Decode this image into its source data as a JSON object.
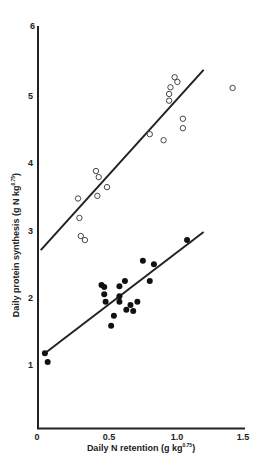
{
  "chart_data": {
    "type": "scatter",
    "title": "",
    "xlabel": "Daily N retention (g kg0.75)",
    "xlabel_main": "Daily N retention (g kg",
    "xlabel_sup": "0.75",
    "xlabel_close": ")",
    "ylabel": "Daily protein synthesis (g N kg0.75)",
    "ylabel_main": "Daily protein synthesis (g N kg",
    "ylabel_sup": "0.75",
    "ylabel_close": ")",
    "xlim": [
      0,
      1.5
    ],
    "ylim": [
      0,
      6
    ],
    "xticks": [
      "0",
      "0.5",
      "1.0",
      "1.5"
    ],
    "yticks": [
      "1",
      "2",
      "3",
      "4",
      "5",
      "6"
    ],
    "grid": false,
    "legend": null,
    "series": [
      {
        "name": "open circles",
        "marker": "open-circle",
        "points": [
          [
            0.29,
            3.47
          ],
          [
            0.3,
            3.18
          ],
          [
            0.31,
            2.91
          ],
          [
            0.34,
            2.85
          ],
          [
            0.42,
            3.88
          ],
          [
            0.44,
            3.79
          ],
          [
            0.43,
            3.51
          ],
          [
            0.5,
            3.64
          ],
          [
            0.81,
            4.43
          ],
          [
            0.91,
            4.34
          ],
          [
            0.95,
            4.93
          ],
          [
            0.95,
            5.03
          ],
          [
            0.96,
            5.13
          ],
          [
            0.99,
            5.28
          ],
          [
            1.01,
            5.21
          ],
          [
            1.05,
            4.66
          ],
          [
            1.05,
            4.52
          ],
          [
            1.41,
            5.12
          ]
        ],
        "fit_line": {
          "x": [
            0.02,
            1.2
          ],
          "y": [
            2.7,
            5.39
          ]
        }
      },
      {
        "name": "filled circles",
        "marker": "filled-circle",
        "points": [
          [
            0.05,
            1.16
          ],
          [
            0.07,
            1.03
          ],
          [
            0.46,
            2.18
          ],
          [
            0.48,
            2.15
          ],
          [
            0.48,
            2.04
          ],
          [
            0.49,
            1.93
          ],
          [
            0.53,
            1.57
          ],
          [
            0.55,
            1.72
          ],
          [
            0.59,
            1.93
          ],
          [
            0.59,
            2.01
          ],
          [
            0.59,
            2.16
          ],
          [
            0.63,
            2.24
          ],
          [
            0.64,
            1.81
          ],
          [
            0.67,
            1.88
          ],
          [
            0.69,
            1.79
          ],
          [
            0.72,
            1.93
          ],
          [
            0.76,
            2.54
          ],
          [
            0.81,
            2.24
          ],
          [
            0.84,
            2.49
          ],
          [
            1.08,
            2.85
          ]
        ],
        "fit_line": {
          "x": [
            0.05,
            1.2
          ],
          "y": [
            1.16,
            2.97
          ]
        }
      }
    ]
  }
}
